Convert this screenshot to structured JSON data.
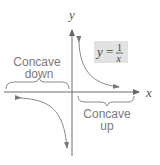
{
  "diagram": {
    "axes": {
      "x_label": "x",
      "y_label": "y"
    },
    "equation": {
      "lhs": "y",
      "equals": "=",
      "numerator": "1",
      "denominator": "x",
      "box_color": "#e2e2e2"
    },
    "regions": [
      {
        "id": "left",
        "line1": "Concave",
        "line2": "down"
      },
      {
        "id": "right",
        "line1": "Concave",
        "line2": "up"
      }
    ],
    "colors": {
      "axis": "#6e6e6e",
      "curve": "#8a8a8a",
      "label": "#7a7a7a"
    }
  }
}
